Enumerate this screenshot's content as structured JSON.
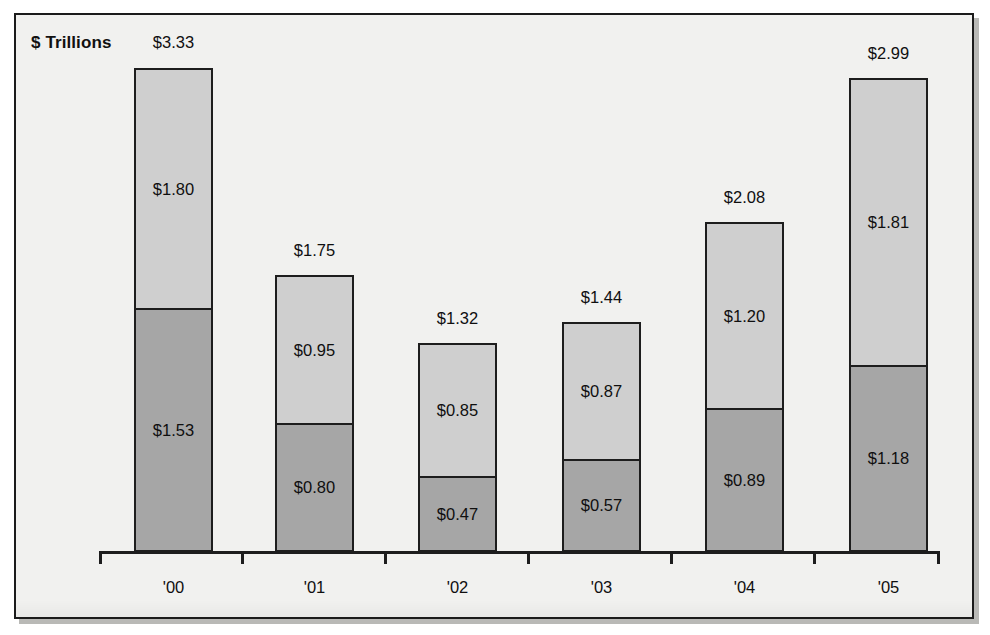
{
  "figure": {
    "title": "$ Trillions",
    "frame_color": "#1d1d1d",
    "background_color": "#f1f1ef"
  },
  "chart_data": {
    "type": "bar",
    "subtype": "stacked",
    "title": "$ Trillions",
    "xlabel": "",
    "ylabel": "$ Trillions",
    "grid": false,
    "legend": "none",
    "axis": {
      "x_ticks_between_categories": true,
      "y_axis_visible": false,
      "baseline_visible": true
    },
    "categories": [
      "'00",
      "'01",
      "'02",
      "'03",
      "'04",
      "'05"
    ],
    "series": [
      {
        "name": "lower-segment",
        "color": "#a6a6a6",
        "values": [
          1.53,
          0.8,
          0.47,
          0.57,
          0.89,
          1.18
        ],
        "labels": [
          "$1.53",
          "$0.80",
          "$0.47",
          "$0.57",
          "$0.89",
          "$1.18"
        ]
      },
      {
        "name": "upper-segment",
        "color": "#cfcfcf",
        "values": [
          1.8,
          0.95,
          0.85,
          0.87,
          1.2,
          1.81
        ],
        "labels": [
          "$1.80",
          "$0.95",
          "$0.85",
          "$0.87",
          "$1.20",
          "$1.81"
        ]
      }
    ],
    "totals": [
      3.33,
      1.75,
      1.32,
      1.44,
      2.08,
      2.99
    ],
    "total_labels": [
      "$3.33",
      "$1.75",
      "$1.32",
      "$1.44",
      "$2.08",
      "$2.99"
    ],
    "ylim": [
      0,
      3.5
    ]
  },
  "bars": [
    {
      "category": "'00",
      "total_label": "$3.33",
      "upper_label": "$1.80",
      "lower_label": "$1.53",
      "left": 134,
      "width": 79,
      "top": 68,
      "divider": 310,
      "baseline": 552,
      "total_label_x": 134,
      "total_label_y": 33,
      "cat_label_x": 134,
      "cat_label_y": 578
    },
    {
      "category": "'01",
      "total_label": "$1.75",
      "upper_label": "$0.95",
      "lower_label": "$0.80",
      "left": 275,
      "width": 79,
      "top": 275,
      "divider": 425,
      "baseline": 552,
      "total_label_x": 275,
      "total_label_y": 241,
      "cat_label_x": 275,
      "cat_label_y": 578
    },
    {
      "category": "'02",
      "total_label": "$1.32",
      "upper_label": "$0.85",
      "lower_label": "$0.47",
      "left": 418,
      "width": 79,
      "top": 343,
      "divider": 478,
      "baseline": 552,
      "total_label_x": 418,
      "total_label_y": 309,
      "cat_label_x": 418,
      "cat_label_y": 578
    },
    {
      "category": "'03",
      "total_label": "$1.44",
      "upper_label": "$0.87",
      "lower_label": "$0.57",
      "left": 562,
      "width": 79,
      "top": 322,
      "divider": 461,
      "baseline": 552,
      "total_label_x": 562,
      "total_label_y": 288,
      "cat_label_x": 562,
      "cat_label_y": 578
    },
    {
      "category": "'04",
      "total_label": "$2.08",
      "upper_label": "$1.20",
      "lower_label": "$0.89",
      "left": 705,
      "width": 79,
      "top": 222,
      "divider": 410,
      "baseline": 552,
      "total_label_x": 705,
      "total_label_y": 188,
      "cat_label_x": 705,
      "cat_label_y": 578
    },
    {
      "category": "'05",
      "total_label": "$2.99",
      "upper_label": "$1.81",
      "lower_label": "$1.18",
      "left": 849,
      "width": 79,
      "top": 78,
      "divider": 367,
      "baseline": 552,
      "total_label_x": 849,
      "total_label_y": 44,
      "cat_label_x": 849,
      "cat_label_y": 578
    }
  ],
  "axis": {
    "ticks_x": [
      99,
      241,
      384,
      527,
      670,
      813,
      937
    ]
  }
}
